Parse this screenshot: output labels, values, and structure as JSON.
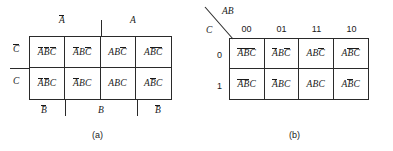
{
  "figure": {
    "maps": [
      {
        "id": "map-a",
        "caption": "(a)",
        "style": "variable-labeled",
        "top_labels": [
          {
            "text": "A",
            "bar": true
          },
          {
            "text": "A",
            "bar": false
          }
        ],
        "bottom_labels": [
          {
            "text": "B",
            "bar": true
          },
          {
            "text": "B",
            "bar": false
          },
          {
            "text": "B",
            "bar": true
          }
        ],
        "row_labels": [
          {
            "text": "C",
            "bar": true
          },
          {
            "text": "C",
            "bar": false
          }
        ],
        "cells": [
          {
            "a_bar": true,
            "b_bar": true,
            "c_bar": true,
            "plain": "A'B'C'"
          },
          {
            "a_bar": true,
            "b_bar": false,
            "c_bar": true,
            "plain": "A'BC'"
          },
          {
            "a_bar": false,
            "b_bar": false,
            "c_bar": true,
            "plain": "ABC'"
          },
          {
            "a_bar": false,
            "b_bar": true,
            "c_bar": true,
            "plain": "AB'C'"
          },
          {
            "a_bar": true,
            "b_bar": true,
            "c_bar": false,
            "plain": "A'B'C"
          },
          {
            "a_bar": true,
            "b_bar": false,
            "c_bar": false,
            "plain": "A'BC"
          },
          {
            "a_bar": false,
            "b_bar": false,
            "c_bar": false,
            "plain": "ABC"
          },
          {
            "a_bar": false,
            "b_bar": true,
            "c_bar": false,
            "plain": "AB'C"
          }
        ]
      },
      {
        "id": "map-b",
        "caption": "(b)",
        "style": "binary-labeled",
        "corner_top": "AB",
        "corner_bottom": "C",
        "column_headers": [
          "00",
          "01",
          "11",
          "10"
        ],
        "row_headers": [
          "0",
          "1"
        ],
        "cells": [
          {
            "a_bar": true,
            "b_bar": true,
            "c_bar": true,
            "plain": "A'B'C'"
          },
          {
            "a_bar": true,
            "b_bar": false,
            "c_bar": true,
            "plain": "A'BC'"
          },
          {
            "a_bar": false,
            "b_bar": false,
            "c_bar": true,
            "plain": "ABC'"
          },
          {
            "a_bar": false,
            "b_bar": true,
            "c_bar": true,
            "plain": "AB'C'"
          },
          {
            "a_bar": true,
            "b_bar": true,
            "c_bar": false,
            "plain": "A'B'C"
          },
          {
            "a_bar": true,
            "b_bar": false,
            "c_bar": false,
            "plain": "A'BC"
          },
          {
            "a_bar": false,
            "b_bar": false,
            "c_bar": false,
            "plain": "ABC"
          },
          {
            "a_bar": false,
            "b_bar": true,
            "c_bar": false,
            "plain": "AB'C"
          }
        ]
      }
    ],
    "variables": [
      "A",
      "B",
      "C"
    ],
    "colors": {
      "line": "#2a2a2a",
      "text": "#1a1a1a",
      "background": "#ffffff"
    }
  }
}
